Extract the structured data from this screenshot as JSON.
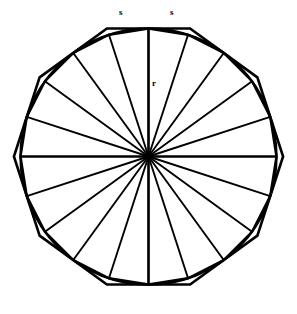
{
  "figure": {
    "kind": "geometry-diagram",
    "background_color": "#ffffff",
    "stroke_color": "#000000",
    "center": {
      "x": 148.5,
      "y": 156.5
    },
    "circle": {
      "name": "inscribed-circle",
      "radius": 128.0
    },
    "outer_polygon": {
      "name": "circumscribed-decagon",
      "sides": 10,
      "apothem": 128.0,
      "rotation_deg": 0
    },
    "inner_polygon": {
      "name": "inscribed-icosagon",
      "sides": 20,
      "circumradius": 128.0,
      "rotation_deg": 0
    },
    "radii": {
      "name": "sector-radii",
      "count": 20,
      "angle_step_deg": 18,
      "length": 128.0
    }
  },
  "labels": {
    "side_left": "s",
    "side_right": "s",
    "radius": "r"
  },
  "chart_data": {
    "type": "diagram",
    "title": "",
    "shapes": [
      {
        "name": "circle",
        "radius": 128
      },
      {
        "name": "circumscribed polygon",
        "sides": 10
      },
      {
        "name": "inscribed polygon",
        "sides": 20
      }
    ],
    "annotations": [
      {
        "text": "s",
        "meaning": "side length",
        "x": 122,
        "y": 13
      },
      {
        "text": "s",
        "meaning": "side length",
        "x": 173,
        "y": 13
      },
      {
        "text": "r",
        "meaning": "radius",
        "x": 154,
        "y": 84
      }
    ]
  }
}
